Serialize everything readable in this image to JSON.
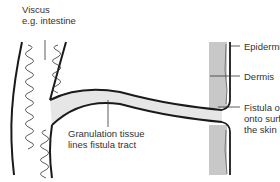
{
  "labels": {
    "viscus_line1": "Viscus",
    "viscus_line2": "e.g. intestine",
    "epidermis": "Epidermis",
    "dermis": "Dermis",
    "granulation_line1": "Granulation tissue",
    "granulation_line2": "lines fistula tract",
    "opening_line1": "Fistula opening",
    "opening_line2": "onto surface of",
    "opening_line3": "the skin"
  },
  "colors": {
    "line": "#1a1a1a",
    "dermis_fill": "#c8c8c8",
    "granulation": "#b0b0b0",
    "text": "#333333"
  }
}
